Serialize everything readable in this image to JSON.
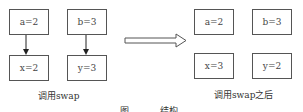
{
  "left_panel": {
    "boxes": {
      "a": "a=2",
      "b": "b=3",
      "x": "x=2",
      "y": "y=3"
    },
    "label": "调用swap"
  },
  "right_panel": {
    "boxes": {
      "a": "a=2",
      "b": "b=3",
      "x": "x=3",
      "y": "y=2"
    },
    "label": "调用swap之后"
  },
  "figure_caption": {
    "prefix": "图",
    "title": "结构"
  },
  "colors": {
    "border": "#555555",
    "text": "#444444",
    "background": "#ffffff"
  }
}
